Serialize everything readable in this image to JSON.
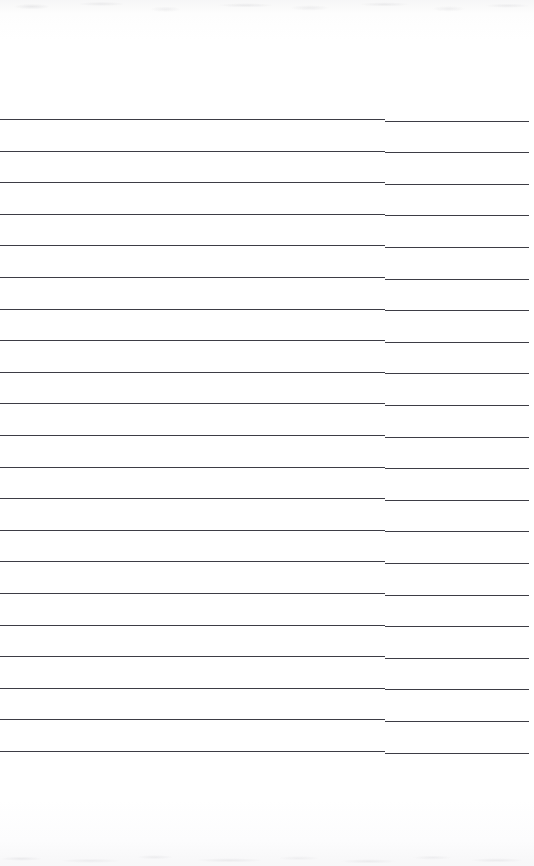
{
  "document": {
    "kind": "scanned-lined-page",
    "page_width": 534,
    "page_height": 866,
    "paper_color": "#ffffff",
    "rule_color": "#3d3d45",
    "rule_thickness": 1.4,
    "text_content": "",
    "visible_text": []
  },
  "layout": {
    "header_margin_height": 118,
    "footer_margin_top": 754,
    "footer_margin_height": 112,
    "rule_left_x": 0,
    "rule_right_x": 529,
    "rule_width": 529,
    "rule_seam_x": 385,
    "first_rule_y": 119,
    "rule_spacing": 31.6,
    "rule_count": 21
  },
  "rules": [
    {
      "index": 1,
      "y": 119.0,
      "left": 0,
      "width": 529
    },
    {
      "index": 2,
      "y": 150.6,
      "left": 0,
      "width": 529
    },
    {
      "index": 3,
      "y": 182.2,
      "left": 0,
      "width": 529
    },
    {
      "index": 4,
      "y": 213.8,
      "left": 0,
      "width": 529
    },
    {
      "index": 5,
      "y": 245.4,
      "left": 0,
      "width": 529
    },
    {
      "index": 6,
      "y": 277.0,
      "left": 0,
      "width": 529
    },
    {
      "index": 7,
      "y": 308.6,
      "left": 0,
      "width": 529
    },
    {
      "index": 8,
      "y": 340.2,
      "left": 0,
      "width": 529
    },
    {
      "index": 9,
      "y": 371.8,
      "left": 0,
      "width": 529
    },
    {
      "index": 10,
      "y": 403.4,
      "left": 0,
      "width": 529
    },
    {
      "index": 11,
      "y": 435.0,
      "left": 0,
      "width": 529
    },
    {
      "index": 12,
      "y": 466.6,
      "left": 0,
      "width": 529
    },
    {
      "index": 13,
      "y": 498.2,
      "left": 0,
      "width": 529
    },
    {
      "index": 14,
      "y": 529.8,
      "left": 0,
      "width": 529
    },
    {
      "index": 15,
      "y": 561.4,
      "left": 0,
      "width": 529
    },
    {
      "index": 16,
      "y": 593.0,
      "left": 0,
      "width": 529
    },
    {
      "index": 17,
      "y": 624.6,
      "left": 0,
      "width": 529
    },
    {
      "index": 18,
      "y": 656.2,
      "left": 0,
      "width": 529
    },
    {
      "index": 19,
      "y": 687.8,
      "left": 0,
      "width": 529
    },
    {
      "index": 20,
      "y": 719.4,
      "left": 0,
      "width": 529
    },
    {
      "index": 21,
      "y": 751.0,
      "left": 0,
      "width": 529
    }
  ],
  "artifacts": {
    "scan_noise_top": true,
    "scan_noise_bottom": true,
    "seam_offset_px": 0.6
  }
}
